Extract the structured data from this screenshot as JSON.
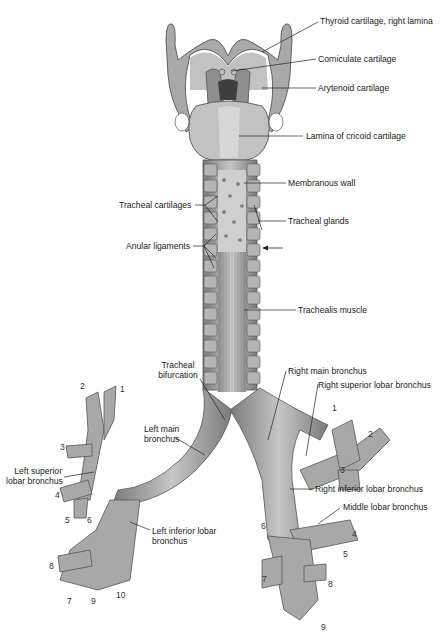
{
  "figure": {
    "colors": {
      "ink": "#222222",
      "cartilage": "#9a9a9a",
      "cartilage_dark": "#6e6e6e",
      "cartilage_light": "#c8c8c8",
      "background": "#ffffff"
    }
  },
  "labels": {
    "thyroid": "Thyroid cartilage, right lamina",
    "corniculate": "Corniculate cartilage",
    "arytenoid": "Arytenoid cartilage",
    "cricoid": "Lamina of cricoid cartilage",
    "membranous_wall": "Membranous wall",
    "tracheal_cartilages": "Tracheal cartilages",
    "tracheal_glands": "Tracheal glands",
    "anular_ligaments": "Anular ligaments",
    "trachealis": "Trachealis muscle",
    "bifurcation_1": "Tracheal",
    "bifurcation_2": "bifurcation",
    "right_main": "Right main bronchus",
    "right_superior": "Right superior lobar bronchus",
    "left_main_1": "Left main",
    "left_main_2": "bronchus",
    "left_superior_1": "Left superior",
    "left_superior_2": "lobar bronchus",
    "right_inferior": "Right inferior lobar bronchus",
    "middle_lobar": "Middle lobar bronchus",
    "left_inferior_1": "Left inferior lobar",
    "left_inferior_2": "bronchus"
  },
  "segment_numbers": {
    "left": [
      "1",
      "2",
      "3",
      "4",
      "5",
      "6",
      "7",
      "8",
      "9",
      "10"
    ],
    "right": [
      "1",
      "2",
      "3",
      "4",
      "5",
      "6",
      "7",
      "8",
      "9"
    ]
  }
}
